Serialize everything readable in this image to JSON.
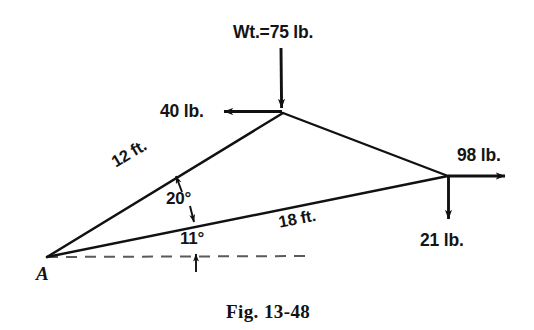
{
  "figure": {
    "caption": "Fig. 13-48",
    "caption_position": "bottom-center"
  },
  "vertices": {
    "support_label": "A",
    "support_point": [
      47,
      257
    ],
    "apex_point": [
      283,
      113
    ],
    "right_point": [
      448,
      176
    ]
  },
  "members": [
    {
      "name": "member-12ft",
      "label": "12 ft.",
      "from": "A",
      "to": "apex",
      "rotation_deg": -31
    },
    {
      "name": "member-18ft",
      "label": "18 ft.",
      "from": "A",
      "to": "right",
      "rotation_deg": -11
    }
  ],
  "forces": [
    {
      "name": "weight",
      "label": "Wt.=75 lb.",
      "magnitude": 75,
      "unit": "lb.",
      "direction": "down",
      "applied_at": "apex"
    },
    {
      "name": "horizontal-load",
      "label": "40 lb.",
      "magnitude": 40,
      "unit": "lb.",
      "direction": "left",
      "applied_at": "apex"
    },
    {
      "name": "tension",
      "label": "98 lb.",
      "magnitude": 98,
      "unit": "lb.",
      "direction": "right",
      "applied_at": "right"
    },
    {
      "name": "vertical-load",
      "label": "21 lb.",
      "magnitude": 21,
      "unit": "lb.",
      "direction": "down",
      "applied_at": "right"
    }
  ],
  "angles": [
    {
      "name": "angle-between-members",
      "label": "20°",
      "value": 20,
      "between": [
        "12 ft.",
        "18 ft."
      ]
    },
    {
      "name": "angle-to-horizontal",
      "label": "11°",
      "value": 11,
      "between": [
        "18 ft.",
        "horizontal datum"
      ]
    }
  ],
  "datum": {
    "name": "horizontal-reference",
    "style": "dashed",
    "from": [
      47,
      257
    ],
    "to": [
      313,
      256
    ]
  },
  "colors": {
    "stroke": "#111111",
    "dashed": "#555555",
    "text": "#141414",
    "background": "#ffffff"
  }
}
